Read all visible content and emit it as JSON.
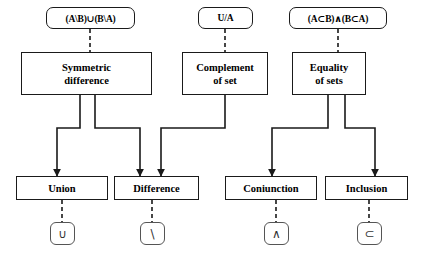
{
  "diagram": {
    "canvas": {
      "width": 421,
      "height": 256,
      "background": "#ffffff"
    },
    "stroke_color": "#1a1a1a",
    "expressions": [
      {
        "id": "expr-symmetric-difference",
        "text": "(A\\B)∪(B\\A)"
      },
      {
        "id": "expr-complement",
        "text": "U/A"
      },
      {
        "id": "expr-equality",
        "text": "(A⊂B)∧(B⊂A)"
      }
    ],
    "concepts": [
      {
        "id": "concept-symmetric-difference",
        "line1": "Symmetric",
        "line2": "difference"
      },
      {
        "id": "concept-complement",
        "line1": "Complement",
        "line2": "of set"
      },
      {
        "id": "concept-equality",
        "line1": "Equality",
        "line2": "of sets"
      }
    ],
    "operations": [
      {
        "id": "op-union",
        "label": "Union",
        "symbol": "∪"
      },
      {
        "id": "op-difference",
        "label": "Difference",
        "symbol": "\\"
      },
      {
        "id": "op-coniunction",
        "label": "Coniunction",
        "symbol": "∧"
      },
      {
        "id": "op-inclusion",
        "label": "Inclusion",
        "symbol": "⊂"
      }
    ]
  }
}
